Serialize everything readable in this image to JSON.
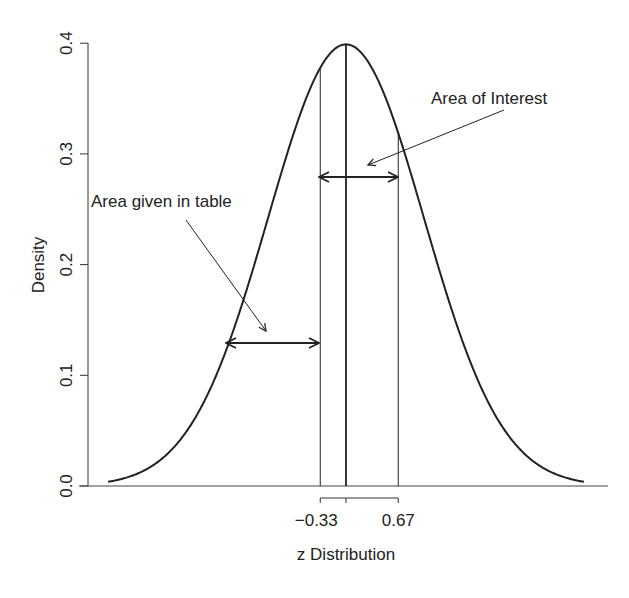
{
  "chart_data": {
    "type": "line",
    "title": "",
    "xlabel": "z Distribution",
    "ylabel": "Density",
    "ylim": [
      0.0,
      0.4
    ],
    "xlim": [
      -3.05,
      3.05
    ],
    "grid": false,
    "y_ticks": [
      "0.0",
      "0.1",
      "0.2",
      "0.3",
      "0.4"
    ],
    "x_ticks": [
      "-0.33",
      "0.67"
    ],
    "x_tick_labels": [
      "−0.33",
      "0.67"
    ],
    "series": [
      {
        "name": "standard normal density",
        "function": "N(0,1) pdf",
        "x_range": [
          -3.05,
          3.05
        ]
      }
    ],
    "vertical_lines": [
      {
        "z": -0.33,
        "style": "thin"
      },
      {
        "z": 0.0,
        "style": "thick"
      },
      {
        "z": 0.67,
        "style": "thin"
      }
    ],
    "annotations": [
      {
        "text": "Area of Interest",
        "arrow_from": "label",
        "arrow_to_z": 0.25,
        "double_arrow": [
          -0.33,
          0.67
        ],
        "arrow_y": 0.28
      },
      {
        "text": "Area given in table",
        "arrow_from": "label",
        "arrow_to_z": -0.75,
        "double_arrow": [
          -2.2,
          -0.33
        ],
        "arrow_y": 0.128
      }
    ]
  }
}
